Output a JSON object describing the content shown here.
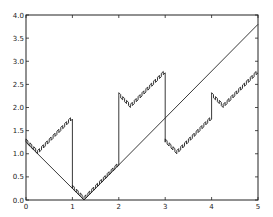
{
  "chart_data": {
    "type": "line",
    "title": "",
    "xlabel": "",
    "ylabel": "",
    "xlim": [
      0,
      5
    ],
    "ylim": [
      0,
      4.0
    ],
    "grid": false,
    "legend": null,
    "x_ticks": [
      "0",
      "1",
      "2",
      "3",
      "4",
      "5"
    ],
    "y_ticks": [
      "0.0",
      "0.5",
      "1.0",
      "1.5",
      "2.0",
      "2.5",
      "3.0",
      "3.5",
      "4.0"
    ],
    "series": [
      {
        "name": "straight",
        "style": "thin line",
        "x": [
          0,
          1.25,
          5
        ],
        "y": [
          1.25,
          0.0,
          3.8
        ]
      },
      {
        "name": "jagged",
        "style": "sawtooth line",
        "x": [
          0,
          0.25,
          1.0,
          1.0,
          1.25,
          2.0,
          2.0,
          2.25,
          3.0,
          3.0,
          3.25,
          4.0,
          4.0,
          4.25,
          5.0
        ],
        "y": [
          1.25,
          1.0,
          1.75,
          0.25,
          0.0,
          0.75,
          2.25,
          2.0,
          2.75,
          1.25,
          1.0,
          1.75,
          2.25,
          2.0,
          2.75
        ]
      }
    ]
  },
  "plot": {
    "left": 26,
    "right": 258,
    "top": 15,
    "bottom": 200,
    "line_color": "#222222",
    "axis_color": "#222222"
  }
}
